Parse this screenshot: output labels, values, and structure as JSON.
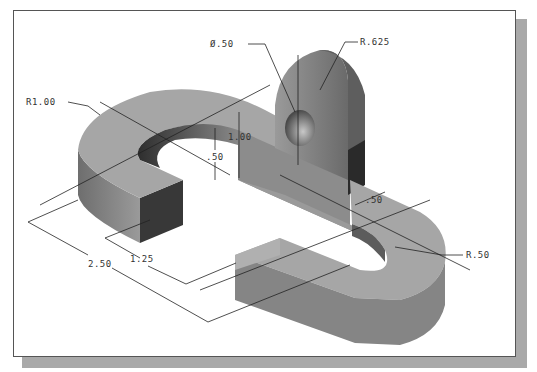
{
  "figure": {
    "colors": {
      "frame_border": "#555555",
      "shadow": "#a9a9a9",
      "top_face": "#a8a8a8",
      "side_face": "#808080",
      "dark_face": "#3a3a3a",
      "dim_line": "#222222"
    }
  },
  "dimensions": {
    "hole_diameter": "Ø.50",
    "lug_radius": "R.625",
    "outer_radius_left": "R1.00",
    "lug_height": "1.00",
    "base_thickness": ".50",
    "slot_width": ".50",
    "inner_radius_right": "R.50",
    "overall_width": "2.50",
    "arm_width": "1.25"
  }
}
